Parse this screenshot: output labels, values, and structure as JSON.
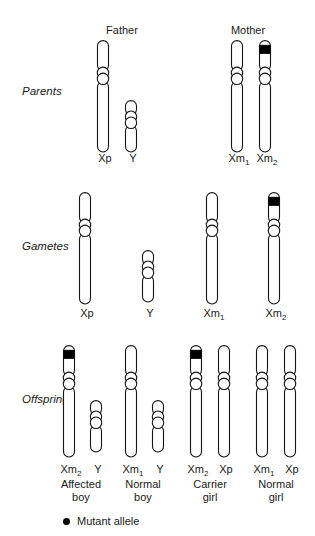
{
  "row_labels": [
    {
      "name": "parents",
      "label": "Parents"
    },
    {
      "name": "gametes",
      "label": "Gametes"
    },
    {
      "name": "offspring",
      "label": "Offspring"
    }
  ],
  "parents": {
    "headers": [
      {
        "name": "father",
        "label": "Father",
        "x": 122
      },
      {
        "name": "mother",
        "label": "Mother",
        "x": 248
      }
    ],
    "chromosomes": [
      {
        "name": "father-x",
        "label": "Xp",
        "label_sub": "",
        "x": 103,
        "top": 40,
        "length": 112,
        "width": 11,
        "centromere_at": 0.32,
        "mutant": false
      },
      {
        "name": "father-y",
        "label": "Y",
        "label_sub": "",
        "x": 131,
        "top": 100,
        "length": 52,
        "width": 11,
        "centromere_at": 0.38,
        "mutant": false
      },
      {
        "name": "mother-x1",
        "label": "Xm",
        "label_sub": "1",
        "x": 237,
        "top": 40,
        "length": 112,
        "width": 11,
        "centromere_at": 0.32,
        "mutant": false
      },
      {
        "name": "mother-x2",
        "label": "Xm",
        "label_sub": "2",
        "x": 265,
        "top": 40,
        "length": 112,
        "width": 11,
        "centromere_at": 0.32,
        "mutant": true
      }
    ],
    "label_y": 152
  },
  "gametes": {
    "chromosomes": [
      {
        "name": "gamete-xp",
        "label": "Xp",
        "label_sub": "",
        "x": 85,
        "top": 192,
        "length": 112,
        "width": 11,
        "centromere_at": 0.32,
        "mutant": false
      },
      {
        "name": "gamete-y",
        "label": "Y",
        "label_sub": "",
        "x": 148,
        "top": 250,
        "length": 52,
        "width": 11,
        "centromere_at": 0.38,
        "mutant": false
      },
      {
        "name": "gamete-xm1",
        "label": "Xm",
        "label_sub": "1",
        "x": 212,
        "top": 192,
        "length": 112,
        "width": 11,
        "centromere_at": 0.32,
        "mutant": false
      },
      {
        "name": "gamete-xm2",
        "label": "Xm",
        "label_sub": "2",
        "x": 274,
        "top": 192,
        "length": 112,
        "width": 11,
        "centromere_at": 0.32,
        "mutant": true
      }
    ],
    "label_y": 307
  },
  "offspring": {
    "groups": [
      {
        "name": "affected-boy",
        "phenotype_line1": "Affected",
        "phenotype_line2": "boy",
        "center_x": 81,
        "chromosomes": [
          {
            "name": "offspring-xm2",
            "label": "Xm",
            "label_sub": "2",
            "x": 69,
            "top": 345,
            "length": 112,
            "width": 11,
            "centromere_at": 0.32,
            "mutant": true
          },
          {
            "name": "offspring-y",
            "label": "Y",
            "label_sub": "",
            "x": 96,
            "top": 400,
            "length": 52,
            "width": 11,
            "centromere_at": 0.38,
            "mutant": false
          }
        ]
      },
      {
        "name": "normal-boy",
        "phenotype_line1": "Normal",
        "phenotype_line2": "boy",
        "center_x": 143,
        "chromosomes": [
          {
            "name": "offspring-xm1",
            "label": "Xm",
            "label_sub": "1",
            "x": 131,
            "top": 345,
            "length": 112,
            "width": 11,
            "centromere_at": 0.32,
            "mutant": false
          },
          {
            "name": "offspring-y-2",
            "label": "Y",
            "label_sub": "",
            "x": 158,
            "top": 400,
            "length": 52,
            "width": 11,
            "centromere_at": 0.38,
            "mutant": false
          }
        ]
      },
      {
        "name": "carrier-girl",
        "phenotype_line1": "Carrier",
        "phenotype_line2": "girl",
        "center_x": 210,
        "chromosomes": [
          {
            "name": "offspring-xm2-b",
            "label": "Xm",
            "label_sub": "2",
            "x": 196,
            "top": 345,
            "length": 112,
            "width": 11,
            "centromere_at": 0.32,
            "mutant": true
          },
          {
            "name": "offspring-xp",
            "label": "Xp",
            "label_sub": "",
            "x": 224,
            "top": 345,
            "length": 112,
            "width": 11,
            "centromere_at": 0.32,
            "mutant": false
          }
        ]
      },
      {
        "name": "normal-girl",
        "phenotype_line1": "Normal",
        "phenotype_line2": "girl",
        "center_x": 276,
        "chromosomes": [
          {
            "name": "offspring-xm1-b",
            "label": "Xm",
            "label_sub": "1",
            "x": 262,
            "top": 345,
            "length": 112,
            "width": 11,
            "centromere_at": 0.32,
            "mutant": false
          },
          {
            "name": "offspring-xp-b",
            "label": "Xp",
            "label_sub": "",
            "x": 290,
            "top": 345,
            "length": 112,
            "width": 11,
            "centromere_at": 0.32,
            "mutant": false
          }
        ]
      }
    ],
    "label_y": 463,
    "phenotype_y": 478
  },
  "legend": {
    "symbol": "mutant-allele-dot",
    "text": "Mutant allele",
    "color": "#000000",
    "x": 63,
    "y": 515
  }
}
